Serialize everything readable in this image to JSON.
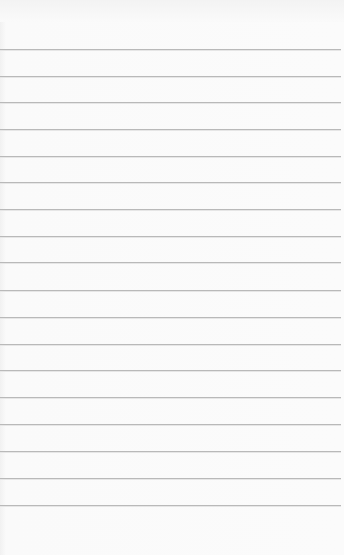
{
  "notepad": {
    "background_color": "#fafafa",
    "line_color": "#b9b9b9",
    "line_count": 18,
    "line_positions_px": [
      49,
      76,
      102,
      129,
      156,
      182,
      209,
      236,
      262,
      290,
      317,
      344,
      370,
      397,
      424,
      451,
      478,
      505
    ],
    "text_content": ""
  }
}
